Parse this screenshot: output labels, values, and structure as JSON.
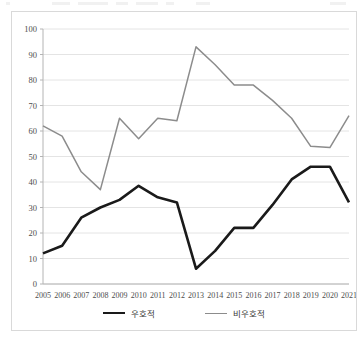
{
  "figure": {
    "background_color": "#ffffff",
    "border_color": "#d9d9d9",
    "gridline_color": "#e4e4e4",
    "axis_color": "#b4b4b4"
  },
  "legend": {
    "position": "bottom-center",
    "entries": [
      {
        "label": "우호적",
        "color": "#1a1a1a",
        "line_width": 2.6
      },
      {
        "label": "비우호적",
        "color": "#8c8c8c",
        "line_width": 1.5
      }
    ]
  },
  "axes": {
    "y_ticks": [
      "0",
      "10",
      "20",
      "30",
      "40",
      "50",
      "60",
      "70",
      "80",
      "90",
      "100"
    ],
    "x_ticks": [
      "2005",
      "2006",
      "2007",
      "2008",
      "2009",
      "2010",
      "2011",
      "2012",
      "2013",
      "2014",
      "2015",
      "2016",
      "2017",
      "2018",
      "2019",
      "2020",
      "2021"
    ]
  },
  "chart_data": {
    "type": "line",
    "title": "",
    "subtitle": "",
    "xlabel": "",
    "ylabel": "",
    "xlim": [
      2005,
      2021
    ],
    "ylim": [
      0,
      100
    ],
    "ytick_step": 10,
    "grid": true,
    "legend_position": "bottom-center",
    "x": [
      2005,
      2006,
      2007,
      2008,
      2009,
      2010,
      2011,
      2012,
      2013,
      2014,
      2015,
      2016,
      2017,
      2018,
      2019,
      2020,
      2021
    ],
    "categories": [
      "2005",
      "2006",
      "2007",
      "2008",
      "2009",
      "2010",
      "2011",
      "2012",
      "2013",
      "2014",
      "2015",
      "2016",
      "2017",
      "2018",
      "2019",
      "2020",
      "2021"
    ],
    "series": [
      {
        "name": "우호적",
        "color": "#1a1a1a",
        "values": [
          12,
          15,
          26,
          30,
          33,
          38.5,
          34,
          32,
          6,
          13,
          22,
          22,
          31,
          41,
          46,
          46,
          32
        ]
      },
      {
        "name": "비우호적",
        "color": "#8c8c8c",
        "values": [
          62,
          58,
          44,
          37,
          65,
          57,
          65,
          64,
          93,
          86,
          78,
          78,
          72,
          65,
          54,
          53.5,
          66
        ]
      }
    ],
    "annotations": []
  }
}
